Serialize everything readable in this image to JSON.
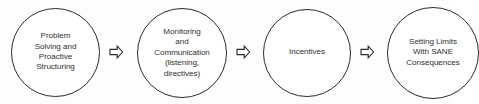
{
  "diagram": {
    "type": "process-flow",
    "title": "",
    "background_color": "#fdfdfd",
    "outline_color": "#2b2b2b",
    "text_color": "#2f2f2f",
    "nodes": [
      {
        "id": "problem-solving",
        "shape": "circle",
        "label": "Problem\nSolving and\nProactive\nStructuring"
      },
      {
        "id": "monitoring-communication",
        "shape": "circle",
        "label": "Monitoring\nand\nCommunication\n(listening,\ndirectives)"
      },
      {
        "id": "incentives",
        "shape": "circle",
        "label": "Incentives"
      },
      {
        "id": "setting-limits",
        "shape": "circle",
        "label": "Setting Limits\nWith SANE\nConsequences"
      }
    ],
    "connectors": [
      {
        "id": "arrow-1",
        "icon": "arrow-right-icon",
        "direction": "right"
      },
      {
        "id": "arrow-2",
        "icon": "arrow-right-icon",
        "direction": "right"
      },
      {
        "id": "arrow-3",
        "icon": "arrow-right-icon",
        "direction": "right"
      }
    ]
  }
}
